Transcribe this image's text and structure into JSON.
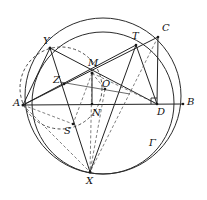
{
  "figure": {
    "canvas": {
      "width": 207,
      "height": 200,
      "background": "#ffffff"
    },
    "stroke_color": "#222222",
    "dash_color": "#555555",
    "points": [
      {
        "id": "A",
        "label": "A",
        "x": 23,
        "y": 105,
        "label_x": 13,
        "label_y": 98
      },
      {
        "id": "B",
        "label": "B",
        "x": 183,
        "y": 104,
        "label_x": 187,
        "label_y": 97
      },
      {
        "id": "C",
        "label": "C",
        "x": 158,
        "y": 37,
        "label_x": 162,
        "label_y": 23
      },
      {
        "id": "D",
        "label": "D",
        "x": 157,
        "y": 104,
        "label_x": 157,
        "label_y": 107
      },
      {
        "id": "M",
        "label": "M",
        "x": 92,
        "y": 73,
        "label_x": 88,
        "label_y": 58
      },
      {
        "id": "N",
        "label": "N",
        "x": 92,
        "y": 104,
        "label_x": 92,
        "label_y": 108
      },
      {
        "id": "O",
        "label": "O",
        "x": 105,
        "y": 89,
        "label_x": 102,
        "label_y": 79
      },
      {
        "id": "S",
        "label": "S",
        "x": 73,
        "y": 124,
        "label_x": 64,
        "label_y": 126
      },
      {
        "id": "T",
        "label": "T",
        "x": 136,
        "y": 45,
        "label_x": 132,
        "label_y": 31
      },
      {
        "id": "X",
        "label": "X",
        "x": 90,
        "y": 172,
        "label_x": 86,
        "label_y": 176
      },
      {
        "id": "Y",
        "label": "Y",
        "x": 50,
        "y": 48,
        "label_x": 43,
        "label_y": 36
      },
      {
        "id": "Z",
        "label": "Z",
        "x": 64,
        "y": 84,
        "label_x": 53,
        "label_y": 75
      },
      {
        "id": "Gamma",
        "label": "Γ",
        "x": 152,
        "y": 148,
        "label_x": 149,
        "label_y": 138
      }
    ],
    "circles": [
      {
        "id": "gamma-outer",
        "name": "circumcircle-gamma",
        "cx": 103,
        "cy": 96,
        "r": 78,
        "style": "solid"
      },
      {
        "id": "inner-circle",
        "name": "second-circle",
        "cx": 103,
        "cy": 103,
        "r": 71,
        "style": "solid"
      },
      {
        "id": "dashed-circle",
        "name": "dashed-small-circle",
        "cx": 61,
        "cy": 88,
        "r": 41,
        "style": "dashed"
      }
    ],
    "segments": [
      {
        "from": "A",
        "to": "B",
        "style": "solid"
      },
      {
        "from": "A",
        "to": "C",
        "style": "solid"
      },
      {
        "from": "C",
        "to": "D",
        "style": "solid"
      },
      {
        "from": "A",
        "to": "Y",
        "style": "solid"
      },
      {
        "from": "Y",
        "to": "X",
        "style": "solid"
      },
      {
        "from": "Y",
        "to": "D",
        "style": "solid"
      },
      {
        "from": "A",
        "to": "T",
        "style": "solid"
      },
      {
        "from": "T",
        "to": "D",
        "style": "solid"
      },
      {
        "from": "T",
        "to": "X",
        "style": "solid"
      },
      {
        "from": "M",
        "to": "X",
        "style": "dashed"
      },
      {
        "from": "M",
        "to": "D",
        "style": "dashed"
      },
      {
        "from": "M",
        "to": "S",
        "style": "dashed"
      },
      {
        "from": "O",
        "to": "X",
        "style": "dashed"
      },
      {
        "from": "A",
        "to": "X",
        "style": "dashed"
      },
      {
        "from": "C",
        "to": "X",
        "style": "dashed"
      },
      {
        "from": "A",
        "to": "S",
        "style": "dashed"
      },
      {
        "from": "Y",
        "to": "M",
        "style": "solid"
      },
      {
        "from": "M",
        "to": "N",
        "style": "solid"
      },
      {
        "from": "Z",
        "to": "O",
        "style": "thin"
      }
    ],
    "right_angle_marker": {
      "at": "D",
      "size": 6
    }
  }
}
